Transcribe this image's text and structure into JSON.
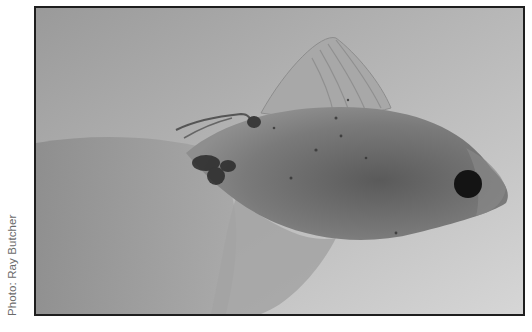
{
  "photo": {
    "subject": "fish",
    "alt": "Grayscale photograph of a pale fish with a dark eye, flowing fins, and a thread-like parasite near the dorsal area",
    "colors": {
      "background_light": "#d2d2d2",
      "background_dark": "#8c8c8c",
      "body": "#6e6e6e",
      "eye": "#141414",
      "frame": "#1e1e1e"
    }
  },
  "caption": {
    "credit": "Photo: Ray Butcher"
  }
}
